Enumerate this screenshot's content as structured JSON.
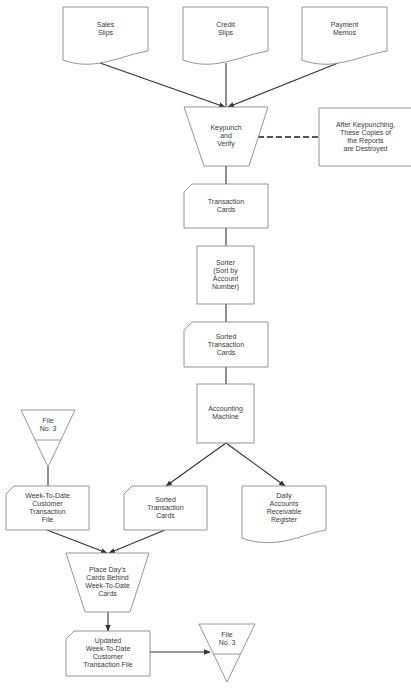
{
  "diagram": {
    "type": "flowchart",
    "nodes": {
      "sales_slips": {
        "label": "Sales\nSlips",
        "shape": "document"
      },
      "credit_slips": {
        "label": "Credit\nSlips",
        "shape": "document"
      },
      "payment_memos": {
        "label": "Payment\nMemos",
        "shape": "document"
      },
      "keypunch": {
        "label": "Keypunch\nand\nVerify",
        "shape": "manual-operation"
      },
      "note": {
        "label": "After Keypunching,\nThese Copies of\nthe Reports\nare Destroyed",
        "shape": "annotation"
      },
      "transaction_cards": {
        "label": "Transaction\nCards",
        "shape": "punched-card"
      },
      "sorter": {
        "label": "Sorter\n(Sort by\nAccount\nNumber)",
        "shape": "process"
      },
      "sorted_cards_1": {
        "label": "Sorted\nTransaction\nCards",
        "shape": "punched-card"
      },
      "accounting_machine": {
        "label": "Accounting\nMachine",
        "shape": "process"
      },
      "file_in": {
        "label": "File\nNo. 3",
        "shape": "offline-storage"
      },
      "week_file": {
        "label": "Week-To-Date\nCustomer\nTransaction\nFile",
        "shape": "punched-card"
      },
      "sorted_cards_2": {
        "label": "Sorted\nTransaction\nCards",
        "shape": "punched-card"
      },
      "daily_register": {
        "label": "Daily\nAccounts\nReceivable\nRegister",
        "shape": "document"
      },
      "place_cards": {
        "label": "Place Day's\nCards Behind\nWeek-To-Date\nCards",
        "shape": "manual-operation"
      },
      "updated_file": {
        "label": "Updated\nWeek-To-Date\nCustomer\nTransaction File",
        "shape": "punched-card"
      },
      "file_out": {
        "label": "File\nNo. 3",
        "shape": "offline-storage"
      }
    },
    "edges": [
      {
        "from": "sales_slips",
        "to": "keypunch"
      },
      {
        "from": "credit_slips",
        "to": "keypunch"
      },
      {
        "from": "payment_memos",
        "to": "keypunch"
      },
      {
        "from": "keypunch",
        "to": "note",
        "style": "dashed"
      },
      {
        "from": "keypunch",
        "to": "transaction_cards"
      },
      {
        "from": "transaction_cards",
        "to": "sorter"
      },
      {
        "from": "sorter",
        "to": "sorted_cards_1"
      },
      {
        "from": "sorted_cards_1",
        "to": "accounting_machine"
      },
      {
        "from": "accounting_machine",
        "to": "sorted_cards_2"
      },
      {
        "from": "accounting_machine",
        "to": "daily_register"
      },
      {
        "from": "file_in",
        "to": "week_file"
      },
      {
        "from": "week_file",
        "to": "place_cards"
      },
      {
        "from": "sorted_cards_2",
        "to": "place_cards"
      },
      {
        "from": "place_cards",
        "to": "updated_file"
      },
      {
        "from": "updated_file",
        "to": "file_out"
      }
    ]
  }
}
